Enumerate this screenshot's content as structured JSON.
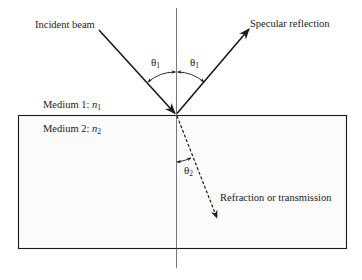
{
  "diagram": {
    "type": "optics-reflection-refraction",
    "labels": {
      "incident": "Incident beam",
      "reflection": "Specular reflection",
      "refraction": "Refraction or transmission",
      "medium1_prefix": "Medium 1: ",
      "medium1_symbol": "n",
      "medium1_sub": "1",
      "medium2_prefix": "Medium 2: ",
      "medium2_symbol": "n",
      "medium2_sub": "2"
    },
    "angles": {
      "theta_symbol": "θ",
      "incident_sub": "1",
      "reflected_sub": "1",
      "refracted_sub": "2"
    },
    "colors": {
      "stroke": "#1a1a1a",
      "normal": "#555555",
      "text": "#222222",
      "medium2_fill": "#fbfbfb"
    }
  }
}
